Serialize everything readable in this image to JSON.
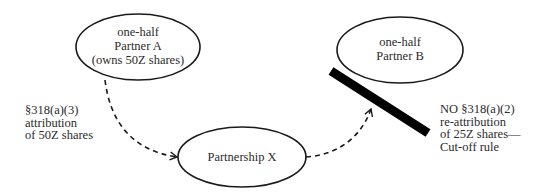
{
  "nodes": {
    "partner_a": {
      "lines": [
        "one-half",
        "Partner A",
        "(owns 50Z shares)"
      ]
    },
    "partner_b": {
      "lines": [
        "one-half",
        "Partner B"
      ]
    },
    "partnership_x": {
      "lines": [
        "Partnership X"
      ]
    }
  },
  "labels": {
    "left": {
      "lines": [
        "§318(a)(3)",
        "attribution",
        "of 50Z shares"
      ]
    },
    "right": {
      "lines": [
        "NO §318(a)(2)",
        "re-attribution",
        "of 25Z shares—",
        "Cut-off rule"
      ]
    }
  },
  "colors": {
    "stroke": "#1a1a1a",
    "text": "#2b2b2b",
    "blocker": "#000000"
  }
}
